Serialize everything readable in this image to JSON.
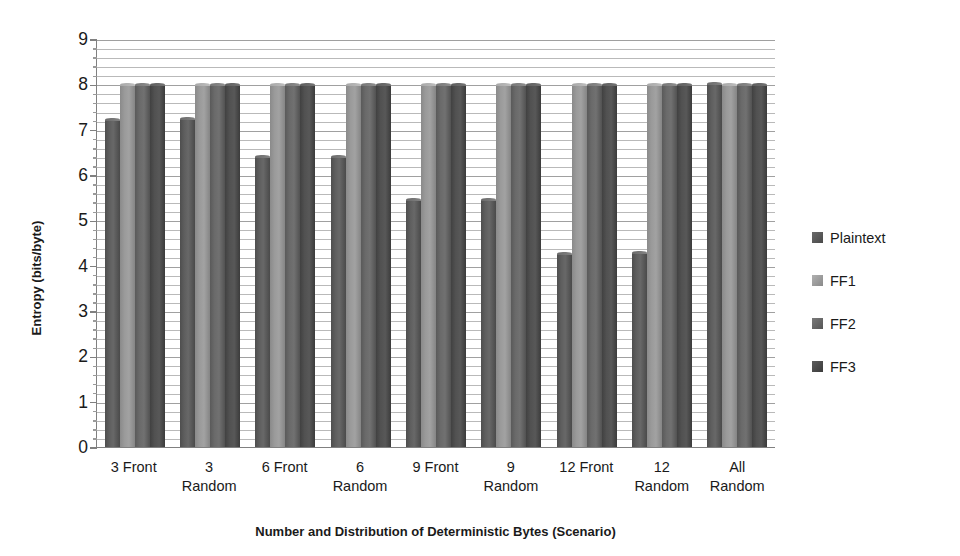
{
  "chart_data": {
    "type": "bar",
    "title": "",
    "xlabel": "Number and Distribution of Deterministic Bytes (Scenario)",
    "ylabel": "Entropy (bits/byte)",
    "ylim": [
      0,
      9
    ],
    "yticks": [
      0,
      1,
      2,
      3,
      4,
      5,
      6,
      7,
      8,
      9
    ],
    "ytick_labels": [
      "0",
      "1",
      "2",
      "3",
      "4",
      "5",
      "6",
      "7",
      "8",
      "9"
    ],
    "grid": true,
    "grid_orientation": "horizontal",
    "legend_position": "right",
    "categories": [
      "3 Front",
      "3 Random",
      "6 Front",
      "6 Random",
      "9 Front",
      "9 Random",
      "12 Front",
      "12 Random",
      "All Random"
    ],
    "category_lines": [
      [
        "3 Front",
        ""
      ],
      [
        "3",
        "Random"
      ],
      [
        "6 Front",
        ""
      ],
      [
        "6",
        "Random"
      ],
      [
        "9 Front",
        ""
      ],
      [
        "9",
        "Random"
      ],
      [
        "12 Front",
        ""
      ],
      [
        "12",
        "Random"
      ],
      [
        "All",
        "Random"
      ]
    ],
    "series": [
      {
        "name": "Plaintext",
        "color": "#595959",
        "values": [
          7.25,
          7.27,
          6.45,
          6.45,
          5.5,
          5.5,
          4.3,
          4.33,
          8.05
        ]
      },
      {
        "name": "FF1",
        "color": "#a0a0a0",
        "values": [
          8.02,
          8.02,
          8.02,
          8.02,
          8.02,
          8.02,
          8.02,
          8.02,
          8.02
        ]
      },
      {
        "name": "FF2",
        "color": "#6b6b6b",
        "values": [
          8.03,
          8.03,
          8.03,
          8.03,
          8.03,
          8.03,
          8.03,
          8.03,
          8.03
        ]
      },
      {
        "name": "FF3",
        "color": "#474747",
        "values": [
          8.04,
          8.04,
          8.04,
          8.04,
          8.04,
          8.04,
          8.04,
          8.04,
          8.04
        ]
      }
    ]
  },
  "legend": {
    "items": [
      {
        "label": "Plaintext"
      },
      {
        "label": "FF1"
      },
      {
        "label": "FF2"
      },
      {
        "label": "FF3"
      }
    ]
  }
}
